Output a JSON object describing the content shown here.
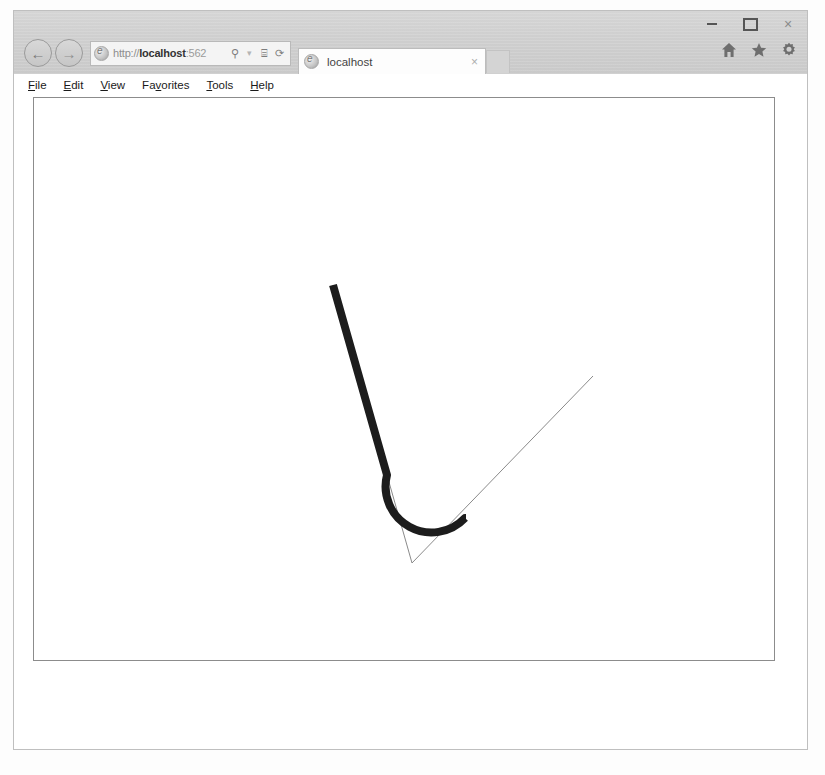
{
  "window": {
    "controls": {
      "minimize_label": "–",
      "maximize_label": "□",
      "close_label": "×"
    }
  },
  "navigation": {
    "back_label": "←",
    "forward_label": "→",
    "address": {
      "scheme": "http://",
      "host": "localhost",
      "port": ":562",
      "full": "http://localhost:562",
      "search_label": "⚲",
      "dropdown_label": "▾",
      "compat_label": "⌸",
      "refresh_label": "⟳"
    }
  },
  "tabs": [
    {
      "title": "localhost",
      "close_label": "×",
      "active": true
    }
  ],
  "command_bar": {
    "home_label": "home-icon",
    "favorites_label": "favorites-icon",
    "tools_label": "tools-icon"
  },
  "menu": {
    "items": [
      {
        "pre": "",
        "accel": "F",
        "post": "ile"
      },
      {
        "pre": "",
        "accel": "E",
        "post": "dit"
      },
      {
        "pre": "",
        "accel": "V",
        "post": "iew"
      },
      {
        "pre": "Fa",
        "accel": "v",
        "post": "orites"
      },
      {
        "pre": "",
        "accel": "T",
        "post": "ools"
      },
      {
        "pre": "",
        "accel": "H",
        "post": "elp"
      }
    ]
  },
  "drawing": {
    "description": "Rounded corner path over original sharp polyline",
    "colors": {
      "thick_stroke": "#1c1c1c",
      "thin_stroke": "#8a8a8a",
      "canvas_background": "#ffffff",
      "canvas_border": "#8c8c8c"
    },
    "thick_path": {
      "stroke_width": 8,
      "d": "M 299 187 L 356 390 A 47 47 0 0 0 431 421 L 431 421"
    },
    "thin_polyline": {
      "stroke_width": 1,
      "points": "299 187 378 465 559 278"
    },
    "vertices": [
      {
        "name": "start",
        "x": 299,
        "y": 187
      },
      {
        "name": "corner",
        "x": 378,
        "y": 465
      },
      {
        "name": "end",
        "x": 559,
        "y": 278
      }
    ]
  }
}
